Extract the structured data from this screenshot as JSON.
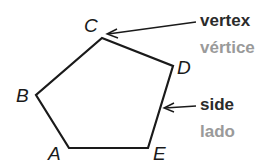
{
  "figure": {
    "shape": "pentagon",
    "vertices": [
      {
        "label": "A",
        "x": 69,
        "y": 148
      },
      {
        "label": "B",
        "x": 36,
        "y": 95
      },
      {
        "label": "C",
        "x": 102,
        "y": 38
      },
      {
        "label": "D",
        "x": 173,
        "y": 66
      },
      {
        "label": "E",
        "x": 148,
        "y": 148
      }
    ],
    "stroke_color": "#1a1a1a"
  },
  "annotations": {
    "vertex": {
      "english": "vertex",
      "spanish": "vértice",
      "points_to": "C"
    },
    "side": {
      "english": "side",
      "spanish": "lado",
      "points_to": "side DE"
    }
  },
  "colors": {
    "english_text": "#2b2b2b",
    "spanish_text": "#9a9a9a"
  }
}
